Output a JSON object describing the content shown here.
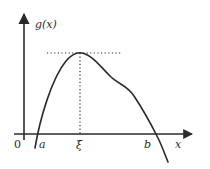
{
  "diagram": {
    "y_axis_label": "g(x)",
    "x_axis_label": "x",
    "origin_label": "0",
    "points": {
      "a": "a",
      "xi": "ξ",
      "b": "b"
    }
  },
  "colors": {
    "stroke": "#2a2a2a",
    "background": "#ffffff"
  }
}
